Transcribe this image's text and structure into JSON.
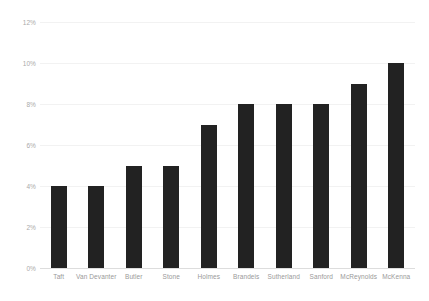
{
  "chart_data": {
    "type": "bar",
    "title": "",
    "subtitle": "",
    "xlabel": "",
    "ylabel": "",
    "categories": [
      "Taft",
      "Van Devanter",
      "Butler",
      "Stone",
      "Holmes",
      "Brandeis",
      "Sutherland",
      "Sanford",
      "McReynolds",
      "McKenna"
    ],
    "values": [
      4,
      4,
      5,
      5,
      7,
      8,
      8,
      8,
      9,
      10
    ],
    "value_unit": "%",
    "ylim": [
      0,
      12
    ],
    "ytick_values": [
      0,
      2,
      4,
      6,
      8,
      10,
      12
    ],
    "ytick_labels": [
      "0%",
      "2%",
      "4%",
      "6%",
      "8%",
      "10%",
      "12%"
    ],
    "grid": true,
    "legend": false,
    "legend_position": "none",
    "bar_color": "#222222",
    "gridline_color": "#f2f2f2",
    "axis_color": "#dddddd",
    "tick_label_color": "#aaaaaa",
    "category_label_color": "#999999",
    "background_color": "#ffffff"
  }
}
